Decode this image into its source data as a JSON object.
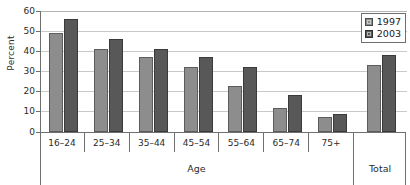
{
  "chart_data": {
    "type": "bar",
    "title": "",
    "xlabel": "Age",
    "ylabel": "Percent",
    "ylim": [
      0,
      60
    ],
    "yticks": [
      0,
      10,
      20,
      30,
      40,
      50,
      60
    ],
    "grid": true,
    "legend_position": "top-right",
    "categories": [
      "16–24",
      "25–34",
      "35–44",
      "45–54",
      "55–64",
      "65–74",
      "75+"
    ],
    "total_category": "Total",
    "series": [
      {
        "name": "1997",
        "color": "#8d8d8d",
        "values": [
          49,
          41,
          37,
          32,
          23,
          12,
          7.5
        ],
        "total": 33
      },
      {
        "name": "2003",
        "color": "#585858",
        "values": [
          56,
          46,
          41,
          37,
          32,
          18.5,
          9
        ],
        "total": 38
      }
    ]
  },
  "axis": {
    "y_label": "Percent",
    "y_ticks": [
      "60",
      "50",
      "40",
      "30",
      "20",
      "10",
      "0"
    ],
    "x_group_label": "Age",
    "x_total_label": "Total"
  },
  "legend": {
    "items": [
      {
        "label": "1997"
      },
      {
        "label": "2003"
      }
    ]
  },
  "categories": [
    {
      "label": "16–24"
    },
    {
      "label": "25–34"
    },
    {
      "label": "35–44"
    },
    {
      "label": "45–54"
    },
    {
      "label": "55–64"
    },
    {
      "label": "65–74"
    },
    {
      "label": "75+"
    }
  ]
}
